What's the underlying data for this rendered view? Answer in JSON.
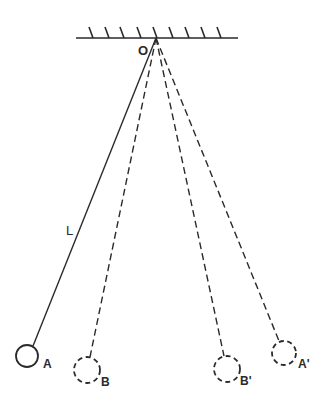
{
  "diagram": {
    "type": "pendulum",
    "colors": {
      "stroke": "#2a2a2a",
      "background": "#ffffff"
    },
    "ceiling": {
      "x1": 76,
      "x2": 238,
      "y": 38,
      "hatch_count": 9
    },
    "pivot": {
      "label": "O",
      "x": 156,
      "y": 38
    },
    "length_label": "L",
    "bobs": [
      {
        "id": "A",
        "label": "A",
        "style": "solid",
        "cx": 27,
        "cy": 356,
        "r": 11
      },
      {
        "id": "B",
        "label": "B",
        "style": "dashed",
        "cx": 87,
        "cy": 370,
        "r": 13
      },
      {
        "id": "B_prime",
        "label": "B'",
        "style": "dashed",
        "cx": 227,
        "cy": 369,
        "r": 13
      },
      {
        "id": "A_prime",
        "label": "A'",
        "style": "dashed",
        "cx": 284,
        "cy": 353,
        "r": 12
      }
    ]
  }
}
